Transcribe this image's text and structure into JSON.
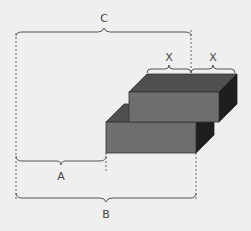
{
  "diagram": {
    "background": "#efefef",
    "labels": {
      "C": "C",
      "X_left": "X",
      "X_right": "X",
      "A": "A",
      "B": "B"
    },
    "colors": {
      "top_face": "#4f4f4f",
      "front_face": "#6e6e6e",
      "side_face": "#1e1e1e",
      "edge": "#333333",
      "brace": "#555555"
    },
    "blocks": [
      {
        "name": "upper-block",
        "front": {
          "x": 129,
          "y": 92,
          "w": 90,
          "h": 30
        },
        "depth": {
          "dx": 18,
          "dy": -18
        }
      },
      {
        "name": "lower-block",
        "front": {
          "x": 106,
          "y": 122,
          "w": 90,
          "h": 31
        },
        "depth": {
          "dx": 18,
          "dy": -18
        }
      }
    ],
    "dimensions": [
      {
        "label": "C",
        "from_x": 16,
        "to_x": 191
      },
      {
        "label": "X",
        "from_x": 147,
        "to_x": 191
      },
      {
        "label": "X",
        "from_x": 191,
        "to_x": 235
      },
      {
        "label": "A",
        "from_x": 16,
        "to_x": 106
      },
      {
        "label": "B",
        "from_x": 16,
        "to_x": 196
      }
    ]
  }
}
